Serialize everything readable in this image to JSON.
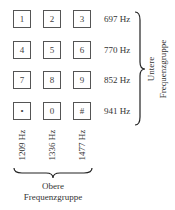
{
  "keypad": {
    "rows": [
      [
        "1",
        "2",
        "3"
      ],
      [
        "4",
        "5",
        "6"
      ],
      [
        "7",
        "8",
        "9"
      ],
      [
        "•",
        "0",
        "#"
      ]
    ]
  },
  "row_frequencies": [
    "697 Hz",
    "770 Hz",
    "852 Hz",
    "941 Hz"
  ],
  "column_frequencies": [
    "1209 Hz",
    "1336 Hz",
    "1477 Hz"
  ],
  "lower_group": {
    "line1": "Untere",
    "line2": "Frequenzgruppe"
  },
  "upper_group": {
    "line1": "Obere",
    "line2": "Frequenzgruppe"
  }
}
